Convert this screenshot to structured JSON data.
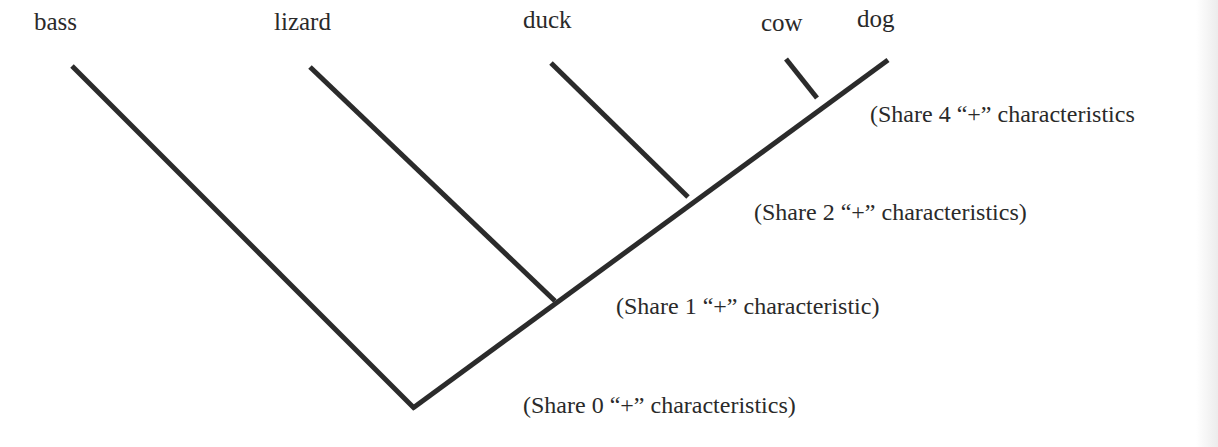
{
  "diagram": {
    "type": "cladogram",
    "line_color": "#2b2b2b",
    "taxa": [
      {
        "name": "bass",
        "x": 34,
        "y": 8
      },
      {
        "name": "lizard",
        "x": 274,
        "y": 8
      },
      {
        "name": "duck",
        "x": 523,
        "y": 6
      },
      {
        "name": "cow",
        "x": 761,
        "y": 9
      },
      {
        "name": "dog",
        "x": 857,
        "y": 5
      }
    ],
    "annotations": [
      {
        "text": "(Share 4 “+” characteristics",
        "x": 870,
        "y": 101
      },
      {
        "text": "(Share 2 “+” characteristics)",
        "x": 754,
        "y": 199
      },
      {
        "text": "(Share 1 “+” characteristic)",
        "x": 616,
        "y": 293
      },
      {
        "text": "(Share 0 “+” characteristics)",
        "x": 523,
        "y": 392
      }
    ]
  }
}
